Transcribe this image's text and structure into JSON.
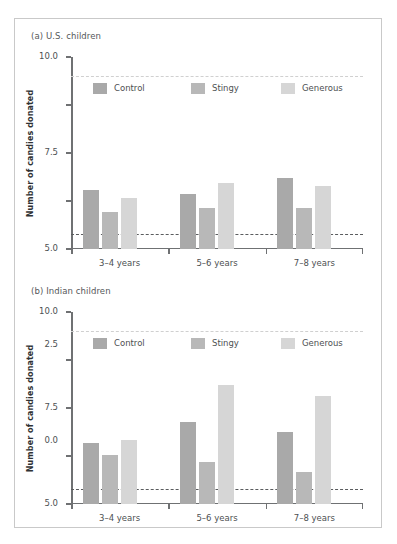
{
  "figure": {
    "panels": [
      {
        "id": "panel-a",
        "title": "(a) U.S. children",
        "chart_index": 0
      },
      {
        "id": "panel-b",
        "title": "(b) Indian children",
        "chart_index": 1
      }
    ]
  },
  "chart_data": [
    {
      "type": "bar",
      "title": "(a) U.S. children",
      "xlabel": "",
      "ylabel": "Number of candies donated",
      "categories": [
        "3–4 years",
        "5–6 years",
        "7–8 years"
      ],
      "series": [
        {
          "name": "Control",
          "values": [
            3.05,
            2.85,
            3.7
          ],
          "color": "#a9a9a9"
        },
        {
          "name": "Stingy",
          "values": [
            1.95,
            2.15,
            2.15
          ],
          "color": "#b8b8b8"
        },
        {
          "name": "Generous",
          "values": [
            2.65,
            3.45,
            3.3
          ],
          "color": "#d6d6d6"
        }
      ],
      "ylim": [
        0,
        10
      ],
      "yticks": [
        "0.0",
        "2.5",
        "5.0",
        "7.5",
        "10.0"
      ],
      "ytick_values": [
        0,
        2.5,
        5,
        7.5,
        10
      ],
      "grid": false,
      "legend_position": "upper-left-inside",
      "reference_lines": [
        {
          "name": "upper-reference-line",
          "value": 9.0,
          "color": "#d0d0d0",
          "style": "dashed"
        },
        {
          "name": "lower-reference-line",
          "value": 0.8,
          "color": "#5a5c5e",
          "style": "dashed"
        }
      ]
    },
    {
      "type": "bar",
      "title": "(b) Indian children",
      "xlabel": "",
      "ylabel": "Number of candies donated",
      "categories": [
        "3–4 years",
        "5–6 years",
        "7–8 years"
      ],
      "series": [
        {
          "name": "Control",
          "values": [
            3.2,
            4.25,
            3.75
          ],
          "color": "#a9a9a9"
        },
        {
          "name": "Stingy",
          "values": [
            2.55,
            2.2,
            1.65
          ],
          "color": "#b8b8b8"
        },
        {
          "name": "Generous",
          "values": [
            3.35,
            6.2,
            5.6
          ],
          "color": "#d6d6d6"
        }
      ],
      "ylim": [
        0,
        10
      ],
      "yticks": [
        "0.0",
        "2.5",
        "5.0",
        "7.5",
        "10.0"
      ],
      "ytick_values": [
        0,
        2.5,
        5,
        7.5,
        10
      ],
      "grid": false,
      "legend_position": "upper-left-inside",
      "reference_lines": [
        {
          "name": "upper-reference-line",
          "value": 9.0,
          "color": "#d0d0d0",
          "style": "dashed"
        },
        {
          "name": "lower-reference-line",
          "value": 0.8,
          "color": "#5a5c5e",
          "style": "dashed"
        }
      ]
    }
  ],
  "colors": {
    "axis": "#6f7173",
    "text": "#4d5052",
    "title": "#55585a",
    "frame": "#c9c9c9",
    "background": "#ffffff"
  }
}
